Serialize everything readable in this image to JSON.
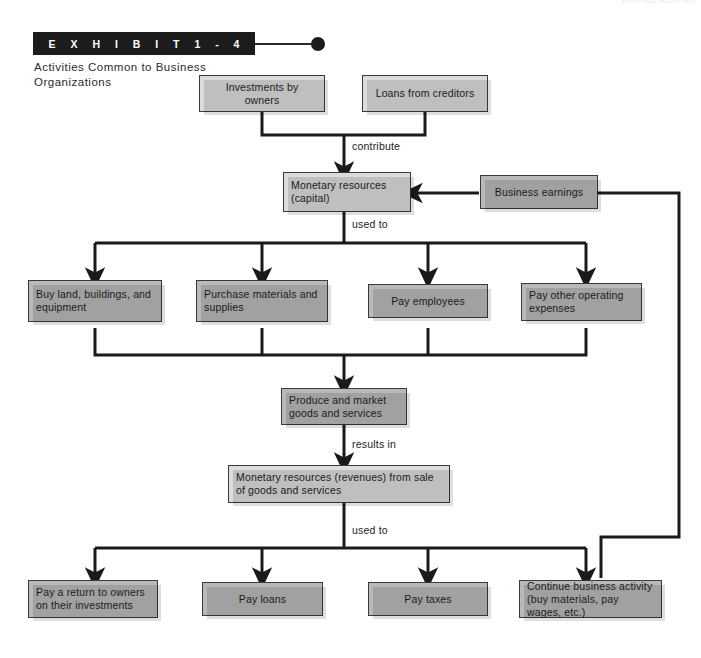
{
  "page": {
    "ghost_header": "Business Activities"
  },
  "exhibit": {
    "banner_label": "E X H I B I T   1 - 4",
    "caption": "Activities Common to Business Organizations"
  },
  "diagram": {
    "type": "flowchart",
    "title": "Activities Common to Business Organizations",
    "nodes": [
      {
        "id": "investments",
        "label": "Investments by owners",
        "tone": "light"
      },
      {
        "id": "loans_cred",
        "label": "Loans from creditors",
        "tone": "light"
      },
      {
        "id": "monetary_cap",
        "label": "Monetary resources (capital)",
        "tone": "light"
      },
      {
        "id": "bus_earnings",
        "label": "Business earnings",
        "tone": "dark"
      },
      {
        "id": "buy_land",
        "label": "Buy land, buildings, and equipment",
        "tone": "dark"
      },
      {
        "id": "purchase_mat",
        "label": "Purchase materials and supplies",
        "tone": "dark"
      },
      {
        "id": "pay_employees",
        "label": "Pay employees",
        "tone": "dark"
      },
      {
        "id": "pay_other",
        "label": "Pay other operating expenses",
        "tone": "dark"
      },
      {
        "id": "produce",
        "label": "Produce and market goods and services",
        "tone": "dark"
      },
      {
        "id": "revenues",
        "label": "Monetary resources (revenues) from sale of goods and services",
        "tone": "light"
      },
      {
        "id": "pay_return",
        "label": "Pay a return to owners on their investments",
        "tone": "dark"
      },
      {
        "id": "pay_loans",
        "label": "Pay loans",
        "tone": "dark"
      },
      {
        "id": "pay_taxes",
        "label": "Pay taxes",
        "tone": "dark"
      },
      {
        "id": "continue_bus",
        "label": "Continue business activity (buy materials, pay wages, etc.)",
        "tone": "dark"
      }
    ],
    "edge_labels": [
      {
        "id": "contribute",
        "label": "contribute"
      },
      {
        "id": "used_to_1",
        "label": "used to"
      },
      {
        "id": "results_in",
        "label": "results in"
      },
      {
        "id": "used_to_2",
        "label": "used to"
      }
    ],
    "colors": {
      "box_light": "#dcdcdc",
      "box_dark": "#b9b9b9",
      "box_border": "#3a3a3a",
      "line": "#1a1a1a",
      "banner_bg": "#1c1c1c",
      "text": "#1a1a1a"
    }
  }
}
